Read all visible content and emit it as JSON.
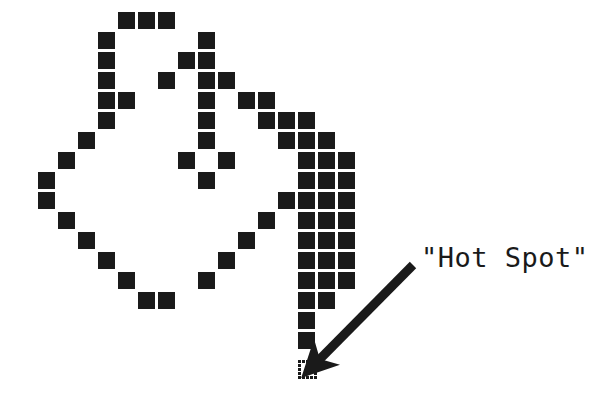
{
  "figure": {
    "title": "Hot Spot",
    "background_color": "#ffffff",
    "pixel_color": "#1a1a1a",
    "grid": {
      "cell_size": 17,
      "cell_pitch": 20,
      "origin_x": 18,
      "origin_y": 12,
      "columns": 19,
      "rows": 18
    }
  },
  "callout": {
    "label": "\"Hot Spot\"",
    "label_x": 421,
    "label_y": 243,
    "font_size": 27,
    "arrow": {
      "from_x": 413,
      "from_y": 265,
      "to_x": 317,
      "to_y": 362,
      "color": "#1a1a1a",
      "width": 9
    }
  },
  "hotspot": {
    "col": 14,
    "row": 17,
    "x": 298,
    "y": 360,
    "style": "dotted-outline"
  },
  "cursor_bitmap": {
    "legend": "Each entry is [column, row] of a filled pixel cell.",
    "filled_cells": [
      [
        5,
        0
      ],
      [
        6,
        0
      ],
      [
        7,
        0
      ],
      [
        4,
        1
      ],
      [
        9,
        1
      ],
      [
        4,
        2
      ],
      [
        8,
        2
      ],
      [
        9,
        2
      ],
      [
        4,
        3
      ],
      [
        7,
        3
      ],
      [
        9,
        3
      ],
      [
        10,
        3
      ],
      [
        4,
        4
      ],
      [
        5,
        4
      ],
      [
        9,
        4
      ],
      [
        11,
        4
      ],
      [
        12,
        4
      ],
      [
        4,
        5
      ],
      [
        9,
        5
      ],
      [
        12,
        5
      ],
      [
        13,
        5
      ],
      [
        14,
        5
      ],
      [
        3,
        6
      ],
      [
        9,
        6
      ],
      [
        13,
        6
      ],
      [
        14,
        6
      ],
      [
        15,
        6
      ],
      [
        2,
        7
      ],
      [
        8,
        7
      ],
      [
        10,
        7
      ],
      [
        14,
        7
      ],
      [
        15,
        7
      ],
      [
        16,
        7
      ],
      [
        1,
        8
      ],
      [
        9,
        8
      ],
      [
        14,
        8
      ],
      [
        15,
        8
      ],
      [
        16,
        8
      ],
      [
        1,
        9
      ],
      [
        13,
        9
      ],
      [
        14,
        9
      ],
      [
        15,
        9
      ],
      [
        16,
        9
      ],
      [
        2,
        10
      ],
      [
        12,
        10
      ],
      [
        14,
        10
      ],
      [
        15,
        10
      ],
      [
        16,
        10
      ],
      [
        3,
        11
      ],
      [
        11,
        11
      ],
      [
        14,
        11
      ],
      [
        15,
        11
      ],
      [
        16,
        11
      ],
      [
        4,
        12
      ],
      [
        10,
        12
      ],
      [
        14,
        12
      ],
      [
        15,
        12
      ],
      [
        16,
        12
      ],
      [
        5,
        13
      ],
      [
        9,
        13
      ],
      [
        14,
        13
      ],
      [
        15,
        13
      ],
      [
        16,
        13
      ],
      [
        6,
        14
      ],
      [
        7,
        14
      ],
      [
        14,
        14
      ],
      [
        15,
        14
      ],
      [
        14,
        15
      ],
      [
        14,
        16
      ]
    ]
  }
}
